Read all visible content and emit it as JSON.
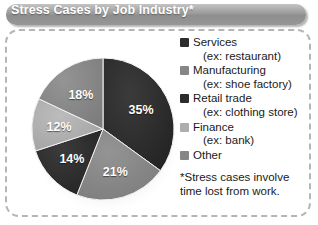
{
  "header": {
    "title": "Stress Cases by Job Industry*"
  },
  "colors": {
    "titlebar": "#9b9b9b",
    "frame_border": "#b5b5b5",
    "dark": "#2c2c2c",
    "medium": "#868686",
    "light": "#adadad",
    "label_text": "#ffffff",
    "body_text": "#1a1a1a"
  },
  "chart_data": {
    "type": "pie",
    "title": "Stress Cases by Job Industry*",
    "categories": [
      "Services",
      "Manufacturing",
      "Retail trade",
      "Finance",
      "Other"
    ],
    "values": [
      35,
      21,
      14,
      12,
      18
    ],
    "value_labels": [
      "35%",
      "21%",
      "14%",
      "12%",
      "18%"
    ],
    "slice_colors": [
      "#2c2c2c",
      "#868686",
      "#2c2c2c",
      "#adadad",
      "#868686"
    ],
    "start_angle_deg": 0,
    "direction": "clockwise",
    "units": "percent",
    "legend_position": "right",
    "grid": false
  },
  "legend": {
    "items": [
      {
        "label": "Services",
        "sub": "(ex: restaurant)",
        "color": "#2c2c2c",
        "swatch_name": "legend-swatch-services"
      },
      {
        "label": "Manufacturing",
        "sub": "(ex: shoe factory)",
        "color": "#868686",
        "swatch_name": "legend-swatch-manufacturing"
      },
      {
        "label": "Retail trade",
        "sub": "(ex: clothing store)",
        "color": "#2c2c2c",
        "swatch_name": "legend-swatch-retail-trade"
      },
      {
        "label": "Finance",
        "sub": "(ex: bank)",
        "color": "#adadad",
        "swatch_name": "legend-swatch-finance"
      },
      {
        "label": "Other",
        "sub": "",
        "color": "#868686",
        "swatch_name": "legend-swatch-other"
      }
    ]
  },
  "footnote": {
    "line1": "*Stress cases involve",
    "line2": "time lost from work."
  }
}
